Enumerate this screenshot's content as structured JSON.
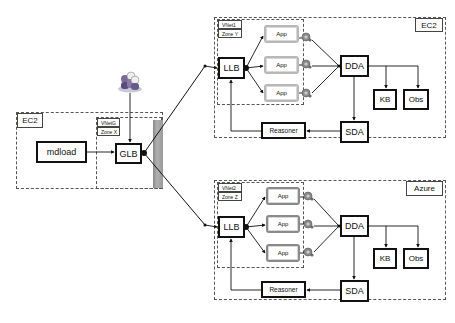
{
  "diagram": {
    "left_region": {
      "cloud_label": "EC2",
      "components": {
        "mdload": "mdload",
        "glb": "GLB"
      },
      "vnet_tag": "VNetG",
      "zone_tag": "Zone X",
      "icons": [
        "users-icon",
        "firewall-icon"
      ]
    },
    "top_region": {
      "cloud_label": "EC2",
      "vnet_tag": "VNet1",
      "zone_tag": "Zone Y",
      "llb": "LLB",
      "apps": [
        "App",
        "App",
        "App"
      ],
      "dda": "DDA",
      "sda": "SDA",
      "kb": "KB",
      "obs": "Obs",
      "reasoner": "Reasoner"
    },
    "bottom_region": {
      "cloud_label": "Azure",
      "vnet_tag": "VNet2",
      "zone_tag": "Zone Z",
      "llb": "LLB",
      "apps": [
        "App",
        "App",
        "App"
      ],
      "dda": "DDA",
      "sda": "SDA",
      "kb": "KB",
      "obs": "Obs",
      "reasoner": "Reasoner"
    },
    "edges": [
      [
        "users",
        "GLB"
      ],
      [
        "mdload",
        "GLB"
      ],
      [
        "GLB",
        "LLB (VNet1)"
      ],
      [
        "GLB",
        "LLB (VNet2)"
      ],
      [
        "LLB",
        "App x3"
      ],
      [
        "App x3",
        "monitor-gear x3"
      ],
      [
        "monitor-gear x3",
        "DDA"
      ],
      [
        "DDA",
        "KB"
      ],
      [
        "DDA",
        "Obs"
      ],
      [
        "DDA",
        "SDA"
      ],
      [
        "SDA",
        "Reasoner"
      ],
      [
        "Reasoner",
        "LLB"
      ]
    ]
  }
}
